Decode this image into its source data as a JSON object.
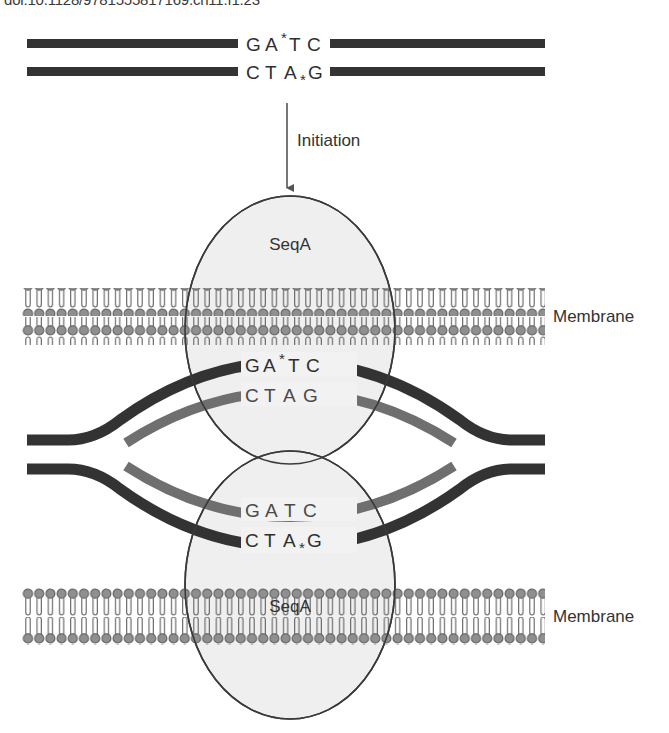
{
  "figure": {
    "caption_top": "doi:10.1128/9781555817169.ch11.f1.23"
  },
  "colors": {
    "parental_strand": "#333333",
    "new_strand": "#6f6f6f",
    "membrane_head": "#8f8f8f",
    "membrane_head_stroke": "#595959",
    "membrane_tail": "#6e6e6e",
    "seqa_fill": "#efefef",
    "seqa_stroke": "#3a3a3a",
    "text": "#333333",
    "background": "#ffffff"
  },
  "steps": {
    "initiation_label": "Initiation",
    "arrow": "down-arrow"
  },
  "unreplicated_dna": {
    "top_strand": {
      "letters": "G A T C",
      "g": "G",
      "a": "A",
      "t": "T",
      "c": "C",
      "methyl_mark": "*",
      "methyl_position": "superscript",
      "color_role": "parental"
    },
    "bottom_strand": {
      "letters": "C T A G",
      "c": "C",
      "t": "T",
      "a": "A",
      "g": "G",
      "methyl_mark": "*",
      "methyl_position": "subscript",
      "color_role": "parental"
    }
  },
  "replication_bubble": {
    "upper_fork": {
      "parental_strand": {
        "g": "G",
        "a": "A",
        "t": "T",
        "c": "C",
        "methyl_mark": "*",
        "methyl_position": "superscript",
        "color_role": "parental"
      },
      "new_strand": {
        "c": "C",
        "t": "T",
        "a": "A",
        "g": "G",
        "methyl_mark": "",
        "color_role": "new"
      }
    },
    "lower_fork": {
      "new_strand": {
        "g": "G",
        "a": "A",
        "t": "T",
        "c": "C",
        "methyl_mark": "",
        "color_role": "new"
      },
      "parental_strand": {
        "c": "C",
        "t": "T",
        "a": "A",
        "g": "G",
        "methyl_mark": "*",
        "methyl_position": "subscript",
        "color_role": "parental"
      }
    }
  },
  "proteins": [
    {
      "name": "SeqA",
      "position": "upper"
    },
    {
      "name": "SeqA",
      "position": "lower"
    }
  ],
  "membranes": [
    {
      "label": "Membrane",
      "position": "upper"
    },
    {
      "label": "Membrane",
      "position": "lower"
    }
  ]
}
